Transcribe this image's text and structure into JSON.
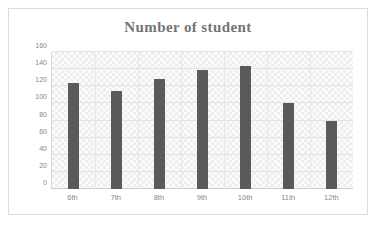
{
  "chart_data": {
    "type": "bar",
    "title": "Number of student",
    "xlabel": "",
    "ylabel": "",
    "categories": [
      "6th",
      "7th",
      "8th",
      "9th",
      "10th",
      "11th",
      "12th"
    ],
    "values": [
      124,
      114,
      129,
      139,
      144,
      100,
      80
    ],
    "ylim": [
      0,
      160
    ],
    "yticks": [
      0,
      20,
      40,
      60,
      80,
      100,
      120,
      140,
      160
    ],
    "grid": true,
    "legend": "none",
    "bar_color": "#5a5a5a",
    "title_color": "#757575",
    "axis_text_color": "#8a8a8a",
    "plot_background": "#fbfbfb",
    "gridline_color": "#e3e3e3",
    "frame_border_color": "#dcdcdc"
  }
}
